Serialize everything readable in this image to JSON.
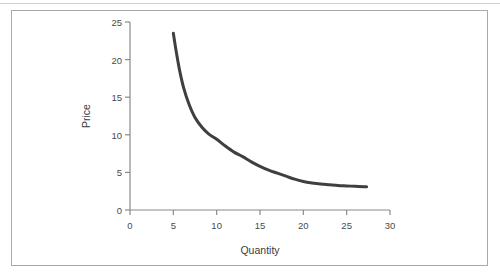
{
  "chart_data": {
    "type": "line",
    "title": "",
    "xlabel": "Quantity",
    "ylabel": "Price",
    "xlim": [
      0,
      30
    ],
    "ylim": [
      0,
      25
    ],
    "xticks": [
      0,
      5,
      10,
      15,
      20,
      25,
      30
    ],
    "yticks": [
      0,
      5,
      10,
      15,
      20,
      25
    ],
    "xtick_labels": [
      "0",
      "5",
      "10",
      "15",
      "20",
      "25",
      "30"
    ],
    "ytick_labels": [
      "0",
      "5",
      "10",
      "15",
      "20",
      "25"
    ],
    "grid": false,
    "legend": null,
    "series": [
      {
        "name": "Demand",
        "color": "#3f3f3f",
        "line_width": 3,
        "x": [
          5.0,
          5.3,
          5.7,
          6.2,
          6.8,
          7.5,
          8.3,
          9.1,
          10.0,
          11.0,
          12.0,
          13.0,
          14.0,
          15.0,
          16.0,
          17.0,
          18.0,
          19.0,
          20.0,
          21.0,
          22.0,
          23.0,
          24.0,
          25.0,
          26.0,
          27.0,
          27.3
        ],
        "y": [
          23.5,
          21.3,
          18.7,
          16.2,
          14.1,
          12.3,
          11.0,
          10.1,
          9.4,
          8.5,
          7.7,
          7.1,
          6.4,
          5.8,
          5.3,
          4.9,
          4.5,
          4.1,
          3.8,
          3.6,
          3.45,
          3.35,
          3.25,
          3.2,
          3.15,
          3.1,
          3.1
        ]
      }
    ]
  },
  "axes": {
    "x_axis_name": "quantity-axis",
    "y_axis_name": "price-axis"
  }
}
